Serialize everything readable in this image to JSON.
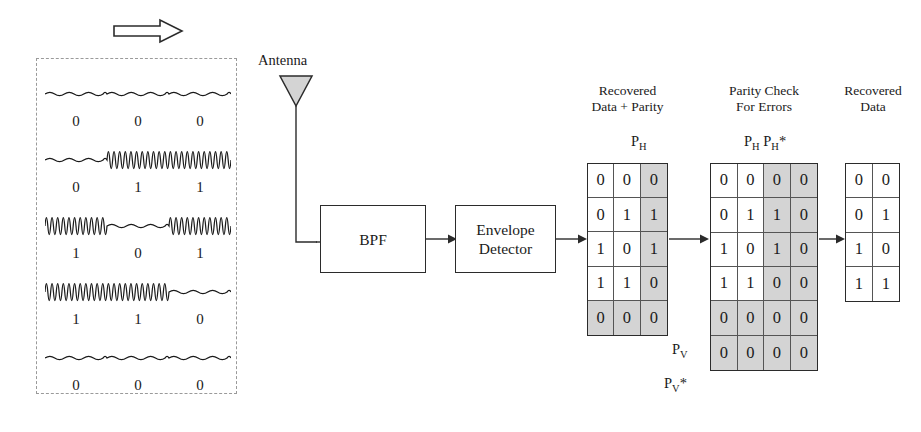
{
  "transmit_panel": {
    "name": "modulated-waveform-panel",
    "direction_arrow": "right-arrow-icon",
    "rows": [
      {
        "bits": [
          "0",
          "0",
          "0"
        ],
        "levels": [
          0,
          0,
          0
        ]
      },
      {
        "bits": [
          "0",
          "1",
          "1"
        ],
        "levels": [
          0,
          1,
          1
        ]
      },
      {
        "bits": [
          "1",
          "0",
          "1"
        ],
        "levels": [
          1,
          0,
          1
        ]
      },
      {
        "bits": [
          "1",
          "1",
          "0"
        ],
        "levels": [
          1,
          1,
          0
        ]
      },
      {
        "bits": [
          "0",
          "0",
          "0"
        ],
        "levels": [
          0,
          0,
          0
        ]
      }
    ]
  },
  "antenna": {
    "label": "Antenna",
    "icon": "antenna-triangle-icon",
    "fill": "#d4d4d4"
  },
  "blocks": [
    {
      "id": "bpf",
      "label": "BPF"
    },
    {
      "id": "envelope",
      "label": "Envelope\nDetector",
      "line1": "Envelope",
      "line2": "Detector"
    }
  ],
  "matrices": {
    "recovered_parity": {
      "heading_line1": "Recovered",
      "heading_line2": "Data + Parity",
      "column_label": "PH",
      "column_label_base": "P",
      "column_label_sub": "H",
      "columns": 3,
      "rows_count": 5,
      "rows": [
        [
          "0",
          "0",
          "0"
        ],
        [
          "0",
          "1",
          "1"
        ],
        [
          "1",
          "0",
          "1"
        ],
        [
          "1",
          "1",
          "0"
        ],
        [
          "0",
          "0",
          "0"
        ]
      ],
      "shaded_columns": [
        2
      ],
      "shaded_rows": [
        4
      ]
    },
    "parity_check": {
      "heading_line1": "Parity Check",
      "heading_line2": "For Errors",
      "column_label": "PH PH*",
      "column_label_a_base": "P",
      "column_label_a_sub": "H",
      "column_label_b_base": "P",
      "column_label_b_sub": "H",
      "column_label_b_star": "*",
      "row_label_pv_base": "P",
      "row_label_pv_sub": "V",
      "row_label_pvstar_base": "P",
      "row_label_pvstar_sub": "V",
      "row_label_pvstar_star": "*",
      "columns": 4,
      "rows_count": 6,
      "rows": [
        [
          "0",
          "0",
          "0",
          "0"
        ],
        [
          "0",
          "1",
          "1",
          "0"
        ],
        [
          "1",
          "0",
          "1",
          "0"
        ],
        [
          "1",
          "1",
          "0",
          "0"
        ],
        [
          "0",
          "0",
          "0",
          "0"
        ],
        [
          "0",
          "0",
          "0",
          "0"
        ]
      ],
      "shaded_columns": [
        2,
        3
      ],
      "shaded_rows": [
        4,
        5
      ]
    },
    "recovered_data": {
      "heading_line1": "Recovered",
      "heading_line2": "Data",
      "columns": 2,
      "rows_count": 4,
      "rows": [
        [
          "0",
          "0"
        ],
        [
          "0",
          "1"
        ],
        [
          "1",
          "0"
        ],
        [
          "1",
          "1"
        ]
      ],
      "shaded_columns": [],
      "shaded_rows": []
    }
  },
  "colors": {
    "ink": "#1a1a1a",
    "line": "#2b2b2b",
    "shade": "#d4d4d4",
    "dashed": "#9a9a9a"
  }
}
